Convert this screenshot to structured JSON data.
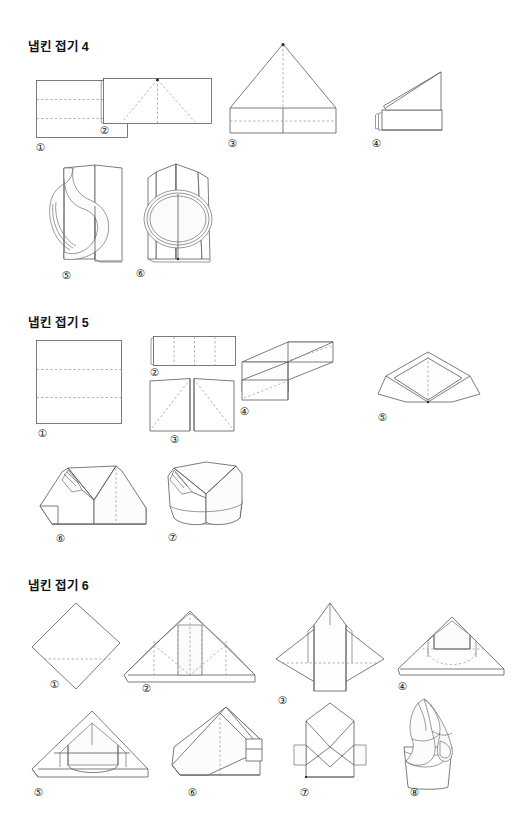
{
  "document": {
    "type": "napkin-folding-instruction-sheet",
    "language": "ko",
    "background_color": "#ffffff",
    "line_color": "#5a5a5a",
    "fold_line_color": "#9a9a9a",
    "width": 527,
    "height": 831
  },
  "sections": [
    {
      "id": "napkin-fold-4",
      "title": "냅킨 접기 4",
      "step_count": 6,
      "steps": [
        {
          "number": "①",
          "shape": "square-with-two-horizontal-fold-lines"
        },
        {
          "number": "②",
          "shape": "wide-rectangle-with-diagonal-fold-lines"
        },
        {
          "number": "③",
          "shape": "house-pentagon-with-horizontal-fold-line"
        },
        {
          "number": "④",
          "shape": "folded-base-with-raised-triangular-flap"
        },
        {
          "number": "⑤",
          "shape": "three-dimensional-curled-napkin-side"
        },
        {
          "number": "⑥",
          "shape": "three-dimensional-curled-napkin-front"
        }
      ]
    },
    {
      "id": "napkin-fold-5",
      "title": "냅킨 접기 5",
      "step_count": 7,
      "steps": [
        {
          "number": "①",
          "shape": "square-with-two-horizontal-fold-lines"
        },
        {
          "number": "②",
          "shape": "wide-rectangle-with-three-vertical-fold-lines"
        },
        {
          "number": "③",
          "shape": "two-panels-with-diagonal-fold-lines"
        },
        {
          "number": "④",
          "shape": "z-shaped-pleated-form"
        },
        {
          "number": "⑤",
          "shape": "diamond-with-inner-triangle-folds"
        },
        {
          "number": "⑥",
          "shape": "double-peak-folded-form"
        },
        {
          "number": "⑦",
          "shape": "finished-standing-double-peak"
        }
      ]
    },
    {
      "id": "napkin-fold-6",
      "title": "냅킨 접기 6",
      "step_count": 8,
      "steps": [
        {
          "number": "①",
          "shape": "diamond-with-horizontal-fold-line"
        },
        {
          "number": "②",
          "shape": "triangle-with-vertical-fold-lines"
        },
        {
          "number": "③",
          "shape": "diamond-with-center-band"
        },
        {
          "number": "④",
          "shape": "trapezoid-with-curved-dashed-pocket"
        },
        {
          "number": "⑤",
          "shape": "triangle-with-folded-pocket"
        },
        {
          "number": "⑥",
          "shape": "angled-fold-with-vertical-crease"
        },
        {
          "number": "⑦",
          "shape": "envelope-fold"
        },
        {
          "number": "⑧",
          "shape": "napkin-placed-in-glass"
        }
      ]
    }
  ]
}
